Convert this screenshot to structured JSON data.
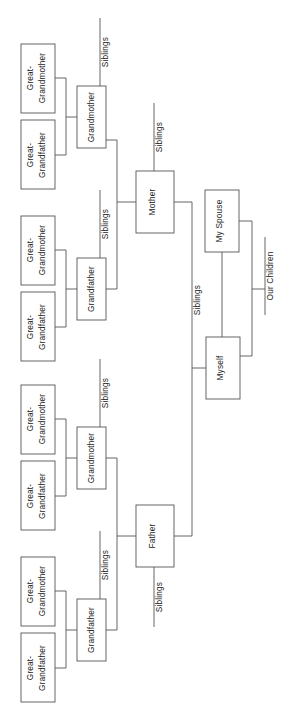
{
  "diagram": {
    "type": "family-tree",
    "orientation": "rotated-90-ccw",
    "background_color": "#ffffff",
    "line_color": "#555555",
    "text_color": "#1a1a1a",
    "labels": {
      "great_grandmother": "Great-\nGrandmother",
      "great_grandmother_line1": "Great-",
      "great_grandmother_line2": "Grandmother",
      "great_grandfather_line1": "Great-",
      "great_grandfather_line2": "Grandfather",
      "grandmother": "Grandmother",
      "grandfather": "Grandfather",
      "mother": "Mother",
      "father": "Father",
      "myself": "Myself",
      "my_spouse": "My Spouse",
      "our_children": "Our Children",
      "siblings": "Siblings"
    },
    "nodes": [
      {
        "id": "ggm-1",
        "name": "great-grandmother-1",
        "label_line1": "Great-",
        "label_line2": "Grandmother",
        "x": 21,
        "y": 44,
        "w": 34,
        "h": 69
      },
      {
        "id": "ggf-1",
        "name": "great-grandfather-1",
        "label_line1": "Great-",
        "label_line2": "Grandfather",
        "x": 21,
        "y": 120,
        "w": 34,
        "h": 69
      },
      {
        "id": "gm-1",
        "name": "grandmother-maternal",
        "label_line1": "Grandmother",
        "label_line2": "",
        "x": 77,
        "y": 86,
        "w": 29,
        "h": 62
      },
      {
        "id": "ggm-2",
        "name": "great-grandmother-2",
        "label_line1": "Great-",
        "label_line2": "Grandmother",
        "x": 21,
        "y": 216,
        "w": 34,
        "h": 69
      },
      {
        "id": "ggf-2",
        "name": "great-grandfather-2",
        "label_line1": "Great-",
        "label_line2": "Grandfather",
        "x": 21,
        "y": 292,
        "w": 34,
        "h": 69
      },
      {
        "id": "gf-1",
        "name": "grandfather-maternal",
        "label_line1": "Grandfather",
        "label_line2": "",
        "x": 77,
        "y": 258,
        "w": 29,
        "h": 62
      },
      {
        "id": "ggm-3",
        "name": "great-grandmother-3",
        "label_line1": "Great-",
        "label_line2": "Grandmother",
        "x": 21,
        "y": 385,
        "w": 34,
        "h": 69
      },
      {
        "id": "ggf-3",
        "name": "great-grandfather-3",
        "label_line1": "Great-",
        "label_line2": "Grandfather",
        "x": 21,
        "y": 461,
        "w": 34,
        "h": 69
      },
      {
        "id": "gm-2",
        "name": "grandmother-paternal",
        "label_line1": "Grandmother",
        "label_line2": "",
        "x": 77,
        "y": 427,
        "w": 29,
        "h": 62
      },
      {
        "id": "ggm-4",
        "name": "great-grandmother-4",
        "label_line1": "Great-",
        "label_line2": "Grandmother",
        "x": 21,
        "y": 557,
        "w": 34,
        "h": 69
      },
      {
        "id": "ggf-4",
        "name": "great-grandfather-4",
        "label_line1": "Great-",
        "label_line2": "Grandfather",
        "x": 21,
        "y": 633,
        "w": 34,
        "h": 69
      },
      {
        "id": "gf-2",
        "name": "grandfather-paternal",
        "label_line1": "Grandfather",
        "label_line2": "",
        "x": 77,
        "y": 599,
        "w": 29,
        "h": 62
      },
      {
        "id": "mother",
        "name": "mother",
        "label_line1": "Mother",
        "label_line2": "",
        "x": 136,
        "y": 171,
        "w": 38,
        "h": 62
      },
      {
        "id": "father",
        "name": "father",
        "label_line1": "Father",
        "label_line2": "",
        "x": 136,
        "y": 505,
        "w": 38,
        "h": 62
      },
      {
        "id": "spouse",
        "name": "my-spouse",
        "label_line1": "My Spouse",
        "label_line2": "",
        "x": 205,
        "y": 190,
        "w": 34,
        "h": 62
      },
      {
        "id": "myself",
        "name": "myself",
        "label_line1": "Myself",
        "label_line2": "",
        "x": 206,
        "y": 337,
        "w": 34,
        "h": 62
      }
    ],
    "sibling_labels": [
      {
        "name": "siblings-grandmother-maternal",
        "text": "Siblings",
        "x": 100,
        "y": 18,
        "len": 68
      },
      {
        "name": "siblings-grandfather-maternal",
        "text": "Siblings",
        "x": 100,
        "y": 190,
        "len": 68
      },
      {
        "name": "siblings-grandmother-paternal",
        "text": "Siblings",
        "x": 100,
        "y": 359,
        "len": 68
      },
      {
        "name": "siblings-grandfather-paternal",
        "text": "Siblings",
        "x": 100,
        "y": 531,
        "len": 68
      },
      {
        "name": "siblings-mother",
        "text": "Siblings",
        "x": 154,
        "y": 103,
        "len": 68
      },
      {
        "name": "siblings-father",
        "text": "Siblings",
        "x": 154,
        "y": 567,
        "len": 60
      },
      {
        "name": "siblings-myself",
        "text": "Siblings",
        "x": 192,
        "y": 232,
        "len": 136
      },
      {
        "name": "our-children",
        "text": "Our Children",
        "x": 265,
        "y": 237,
        "len": 78
      }
    ]
  }
}
